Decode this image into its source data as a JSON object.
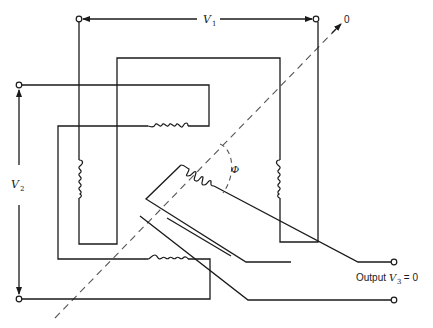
{
  "diagram": {
    "labels": {
      "v1": "V",
      "v1_sub": "1",
      "v2": "V",
      "v2_sub": "2",
      "phi": "Φ",
      "zero": "0",
      "output_prefix": "Output ",
      "v3": "V",
      "v3_sub": "3",
      "output_suffix": " = 0"
    },
    "components": [
      {
        "id": "stator-winding-left",
        "type": "coil",
        "orientation": "vertical"
      },
      {
        "id": "stator-winding-right",
        "type": "coil",
        "orientation": "vertical"
      },
      {
        "id": "stator-winding-top",
        "type": "coil",
        "orientation": "horizontal"
      },
      {
        "id": "stator-winding-bottom",
        "type": "coil",
        "orientation": "horizontal"
      },
      {
        "id": "rotor-winding",
        "type": "coil",
        "orientation": "angled"
      }
    ],
    "terminals": [
      "v1-left",
      "v1-right",
      "v2-top",
      "v2-bottom",
      "output-top",
      "output-bottom"
    ],
    "colors": {
      "line": "#1a1a1a",
      "dash": "#555555",
      "background": "#ffffff"
    }
  }
}
